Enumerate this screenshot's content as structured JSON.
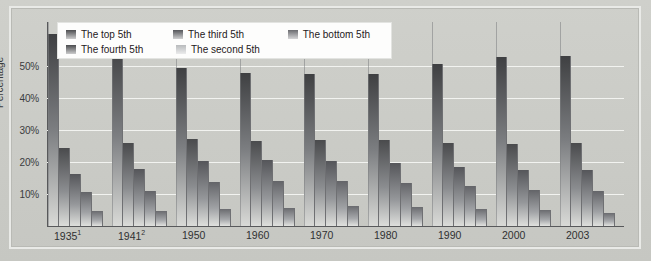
{
  "chart_data": {
    "type": "bar",
    "title": "",
    "xlabel": "",
    "ylabel": "Percentage",
    "ylim": [
      0,
      55
    ],
    "grid": true,
    "legend_position": "top-left",
    "categories": [
      "1935¹",
      "1941²",
      "1950",
      "1960",
      "1970",
      "1980",
      "1990",
      "2000",
      "2003"
    ],
    "series": [
      {
        "name": "The top 5th",
        "values": [
          51.7,
          48.8,
          42.7,
          41.3,
          40.9,
          41.1,
          43.7,
          45.5,
          45.8
        ]
      },
      {
        "name": "The fourth 5th",
        "values": [
          20.9,
          22.3,
          23.4,
          22.8,
          23.2,
          23.2,
          22.3,
          22.0,
          22.5
        ]
      },
      {
        "name": "The third 5th",
        "values": [
          14.1,
          15.3,
          17.4,
          17.9,
          17.4,
          17.0,
          15.9,
          15.0,
          15.0
        ]
      },
      {
        "name": "The second 5th",
        "values": [
          9.2,
          9.5,
          12.0,
          12.2,
          12.2,
          11.6,
          10.8,
          9.6,
          9.5
        ]
      },
      {
        "name": "The bottom 5th",
        "values": [
          4.1,
          4.1,
          4.5,
          4.8,
          5.4,
          5.1,
          4.6,
          4.3,
          3.5
        ]
      }
    ],
    "y_ticks": [
      "10%",
      "20%",
      "30%",
      "40%",
      "50%"
    ],
    "y_tick_values": [
      10,
      20,
      30,
      40,
      50
    ]
  },
  "axis": {
    "y_title": "Percentage",
    "y_ticks": [
      "50%",
      "40%",
      "30%",
      "20%",
      "10%"
    ]
  },
  "legend": {
    "items": [
      {
        "label": "The top 5th",
        "color": "#4c4d4f"
      },
      {
        "label": "The third 5th",
        "color": "#55565a"
      },
      {
        "label": "The bottom 5th",
        "color": "#6a6b6f"
      },
      {
        "label": "The fourth 5th",
        "color": "#4a4b4d"
      },
      {
        "label": "The second 5th",
        "color": "#b8babc"
      }
    ]
  },
  "xaxis": {
    "labels": [
      "1935",
      "1941",
      "1950",
      "1960",
      "1970",
      "1980",
      "1990",
      "2000",
      "2003"
    ],
    "superscripts": [
      "1",
      "2",
      "",
      "",
      "",
      "",
      "",
      "",
      ""
    ]
  }
}
